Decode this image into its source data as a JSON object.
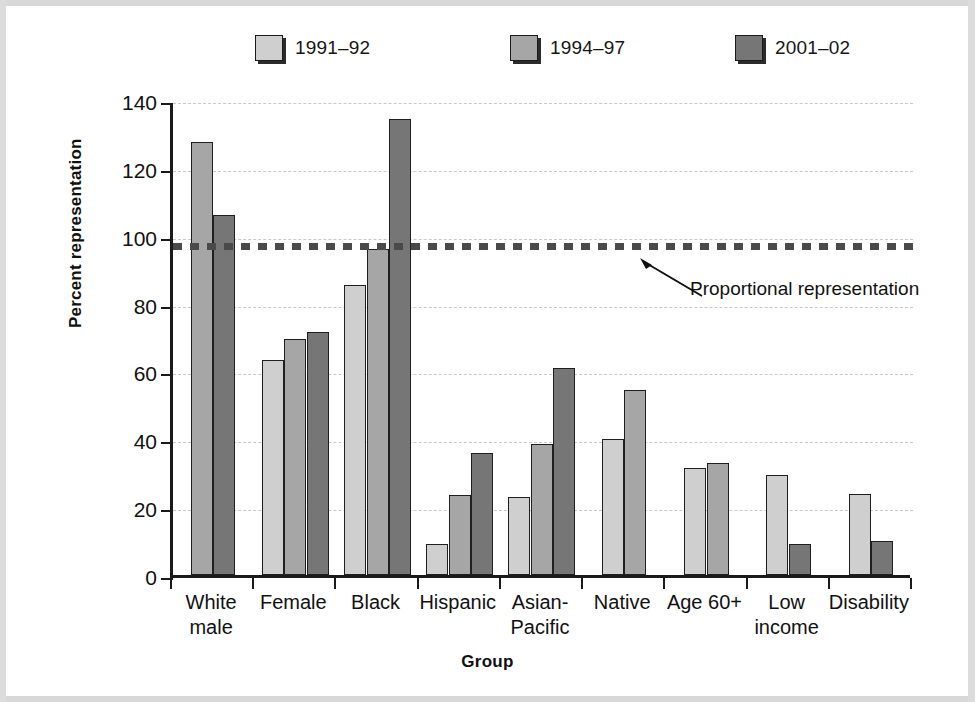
{
  "chart_data": {
    "type": "bar",
    "title": "",
    "xlabel": "Group",
    "ylabel": "Percent representation",
    "ylim": [
      0,
      140
    ],
    "yticks": [
      0,
      20,
      40,
      60,
      80,
      100,
      120,
      140
    ],
    "grid": true,
    "legend_position": "top",
    "categories": [
      "White male",
      "Female",
      "Black",
      "Hispanic",
      "Asian-Pacific",
      "Native",
      "Age 60+",
      "Low income",
      "Disability"
    ],
    "category_lines": [
      [
        "White",
        "male"
      ],
      [
        "Female"
      ],
      [
        "Black"
      ],
      [
        "Hispanic"
      ],
      [
        "Asian-",
        "Pacific"
      ],
      [
        "Native"
      ],
      [
        "Age 60+"
      ],
      [
        "Low",
        "income"
      ],
      [
        "Disability"
      ]
    ],
    "series": [
      {
        "name": "1991–92",
        "color": "#cfcfcf",
        "values": [
          null,
          63.5,
          85.5,
          9,
          23,
          40,
          31.5,
          29.5,
          24
        ]
      },
      {
        "name": "1994–97",
        "color": "#a6a6a6",
        "values": [
          127.5,
          69.5,
          96,
          23.5,
          38.5,
          54.5,
          33,
          null,
          null
        ]
      },
      {
        "name": "2001–02",
        "color": "#767676",
        "values": [
          106,
          71.5,
          134.5,
          36,
          61,
          null,
          null,
          9,
          10
        ]
      }
    ],
    "annotations": [
      {
        "text": "Proportional representation",
        "value": 98,
        "style": "dotted-reference-line"
      }
    ]
  },
  "legend": {
    "items": [
      {
        "label": "1991–92",
        "color": "#cfcfcf"
      },
      {
        "label": "1994–97",
        "color": "#a6a6a6"
      },
      {
        "label": "2001–02",
        "color": "#767676"
      }
    ]
  },
  "axes": {
    "y_title": "Percent representation",
    "x_title": "Group",
    "y_tick_labels": [
      "140",
      "120",
      "100",
      "80",
      "60",
      "40",
      "20",
      "0"
    ]
  },
  "annotation": {
    "reference_label": "Proportional representation"
  }
}
